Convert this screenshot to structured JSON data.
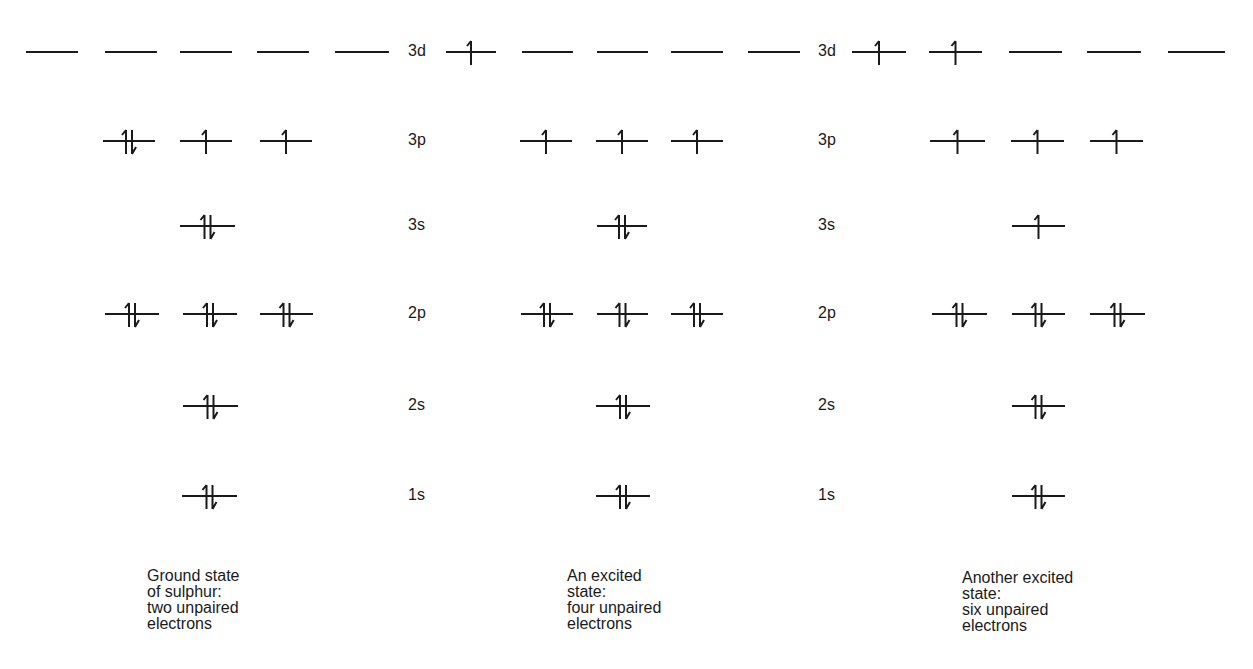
{
  "rows": [
    {
      "key": "3d",
      "y": 52
    },
    {
      "key": "3p",
      "y": 141
    },
    {
      "key": "3s",
      "y": 226
    },
    {
      "key": "2p",
      "y": 314
    },
    {
      "key": "2s",
      "y": 406
    },
    {
      "key": "1s",
      "y": 496
    }
  ],
  "diagrams": [
    {
      "id": "ground",
      "label_x": 408,
      "labels": {
        "3d": "3d",
        "3p": "3p",
        "3s": "3s",
        "2p": "2p",
        "2s": "2s",
        "1s": "1s"
      },
      "caption": {
        "x": 147,
        "y": 568,
        "lines": [
          "Ground state",
          "of sulphur:",
          "two unpaired",
          "electrons"
        ]
      },
      "orbitals": {
        "3d": [
          {
            "x": 26,
            "w": 52,
            "e": 0
          },
          {
            "x": 105,
            "w": 52,
            "e": 0
          },
          {
            "x": 180,
            "w": 52,
            "e": 0
          },
          {
            "x": 257,
            "w": 52,
            "e": 0
          },
          {
            "x": 335,
            "w": 54,
            "e": 0
          }
        ],
        "3p": [
          {
            "x": 103,
            "w": 52,
            "e": 2
          },
          {
            "x": 180,
            "w": 52,
            "e": 1
          },
          {
            "x": 260,
            "w": 52,
            "e": 1
          }
        ],
        "3s": [
          {
            "x": 180,
            "w": 55,
            "e": 2
          }
        ],
        "2p": [
          {
            "x": 105,
            "w": 54,
            "e": 2
          },
          {
            "x": 183,
            "w": 54,
            "e": 2
          },
          {
            "x": 260,
            "w": 53,
            "e": 2
          }
        ],
        "2s": [
          {
            "x": 183,
            "w": 55,
            "e": 2
          }
        ],
        "1s": [
          {
            "x": 182,
            "w": 55,
            "e": 2
          }
        ]
      }
    },
    {
      "id": "excited-four",
      "label_x": 818,
      "labels": {
        "3d": "3d",
        "3p": "3p",
        "3s": "3s",
        "2p": "2p",
        "2s": "2s",
        "1s": "1s"
      },
      "caption": {
        "x": 567,
        "y": 568,
        "lines": [
          "An excited",
          "state:",
          "four unpaired",
          "electrons"
        ]
      },
      "orbitals": {
        "3d": [
          {
            "x": 446,
            "w": 50,
            "e": 1
          },
          {
            "x": 522,
            "w": 51,
            "e": 0
          },
          {
            "x": 597,
            "w": 51,
            "e": 0
          },
          {
            "x": 671,
            "w": 52,
            "e": 0
          },
          {
            "x": 748,
            "w": 52,
            "e": 0
          }
        ],
        "3p": [
          {
            "x": 520,
            "w": 52,
            "e": 1
          },
          {
            "x": 596,
            "w": 52,
            "e": 1
          },
          {
            "x": 671,
            "w": 52,
            "e": 1
          }
        ],
        "3s": [
          {
            "x": 597,
            "w": 50,
            "e": 2
          }
        ],
        "2p": [
          {
            "x": 521,
            "w": 52,
            "e": 2
          },
          {
            "x": 597,
            "w": 51,
            "e": 2
          },
          {
            "x": 671,
            "w": 52,
            "e": 2
          }
        ],
        "2s": [
          {
            "x": 596,
            "w": 54,
            "e": 2
          }
        ],
        "1s": [
          {
            "x": 596,
            "w": 54,
            "e": 2
          }
        ]
      }
    },
    {
      "id": "excited-six",
      "label_x": 818,
      "labels": {
        "3d": "3d",
        "3p": "3p",
        "3s": "3s",
        "2p": "2p",
        "2s": "2s",
        "1s": "1s"
      },
      "caption": {
        "x": 962,
        "y": 570,
        "lines": [
          "Another excited",
          "state:",
          "six unpaired",
          "electrons"
        ]
      },
      "orbitals": {
        "3d": [
          {
            "x": 852,
            "w": 54,
            "e": 1
          },
          {
            "x": 929,
            "w": 53,
            "e": 1
          },
          {
            "x": 1009,
            "w": 53,
            "e": 0
          },
          {
            "x": 1087,
            "w": 54,
            "e": 0
          },
          {
            "x": 1168,
            "w": 57,
            "e": 0
          }
        ],
        "3p": [
          {
            "x": 930,
            "w": 55,
            "e": 1
          },
          {
            "x": 1011,
            "w": 53,
            "e": 1
          },
          {
            "x": 1090,
            "w": 53,
            "e": 1
          }
        ],
        "3s": [
          {
            "x": 1012,
            "w": 53,
            "e": 1
          }
        ],
        "2p": [
          {
            "x": 932,
            "w": 55,
            "e": 2
          },
          {
            "x": 1012,
            "w": 53,
            "e": 2
          },
          {
            "x": 1090,
            "w": 55,
            "e": 2
          }
        ],
        "2s": [
          {
            "x": 1012,
            "w": 53,
            "e": 2
          }
        ],
        "1s": [
          {
            "x": 1012,
            "w": 53,
            "e": 2
          }
        ]
      }
    }
  ],
  "shared_label_columns": [
    408,
    818
  ],
  "colors": {
    "ink": "#1a1a1a",
    "background": "#ffffff"
  }
}
